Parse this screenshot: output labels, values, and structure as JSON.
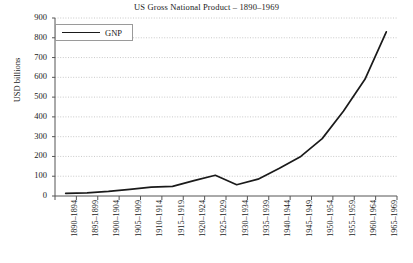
{
  "chart_data": {
    "type": "line",
    "title": "US Gross National Product – 1890–1969",
    "xlabel": "",
    "ylabel": "USD billions",
    "ylim": [
      0,
      900
    ],
    "ytick_step": 100,
    "yticks": [
      0,
      100,
      200,
      300,
      400,
      500,
      600,
      700,
      800,
      900
    ],
    "grid": "horizontal-dotted",
    "legend_position": "top-left",
    "legend": [
      "GNP"
    ],
    "categories": [
      "1890–1894",
      "1895–1899",
      "1900–1904",
      "1905–1909",
      "1910–1914",
      "1915–1919",
      "1920–1924",
      "1925–1929",
      "1930–1934",
      "1935–1939",
      "1940–1944",
      "1945–1949",
      "1950–1954",
      "1955–1959",
      "1960–1964",
      "1965–1969"
    ],
    "series": [
      {
        "name": "GNP",
        "color": "#1a1a1a",
        "values": [
          13,
          16,
          23,
          33,
          45,
          49,
          78,
          105,
          57,
          85,
          140,
          200,
          290,
          430,
          590,
          830
        ]
      }
    ]
  }
}
